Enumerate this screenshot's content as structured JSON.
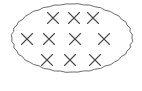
{
  "figure": {
    "name": "set-diagram-ellipse-with-x-marks",
    "background_color": "#ffffff",
    "canvas": {
      "width": 142,
      "height": 91
    }
  },
  "boundary": {
    "shape_label": "ellipse",
    "stroke_color": "#6b6b6b",
    "stroke_width": 1,
    "fill": "none",
    "center_x": 72,
    "center_y": 38,
    "radius_x": 60,
    "radius_y": 34
  },
  "marks": {
    "glyph": "x-mark",
    "symbol": "✕",
    "count_total": 10,
    "stroke_color": "#4a4a4a",
    "stroke_width": 1.1,
    "size": 11,
    "rows": [
      {
        "row_label": "top-row",
        "count": 3,
        "y": 18,
        "items": [
          {
            "index": 0,
            "x": 53,
            "y": 18
          },
          {
            "index": 1,
            "x": 74,
            "y": 18
          },
          {
            "index": 2,
            "x": 93,
            "y": 18
          }
        ]
      },
      {
        "row_label": "middle-row",
        "count": 4,
        "y": 39,
        "items": [
          {
            "index": 0,
            "x": 27,
            "y": 39
          },
          {
            "index": 1,
            "x": 49,
            "y": 39
          },
          {
            "index": 2,
            "x": 75,
            "y": 39
          },
          {
            "index": 3,
            "x": 104,
            "y": 39
          }
        ]
      },
      {
        "row_label": "bottom-row",
        "count": 3,
        "y": 60,
        "items": [
          {
            "index": 0,
            "x": 47,
            "y": 60
          },
          {
            "index": 1,
            "x": 70,
            "y": 60
          },
          {
            "index": 2,
            "x": 95,
            "y": 60
          }
        ]
      }
    ]
  }
}
